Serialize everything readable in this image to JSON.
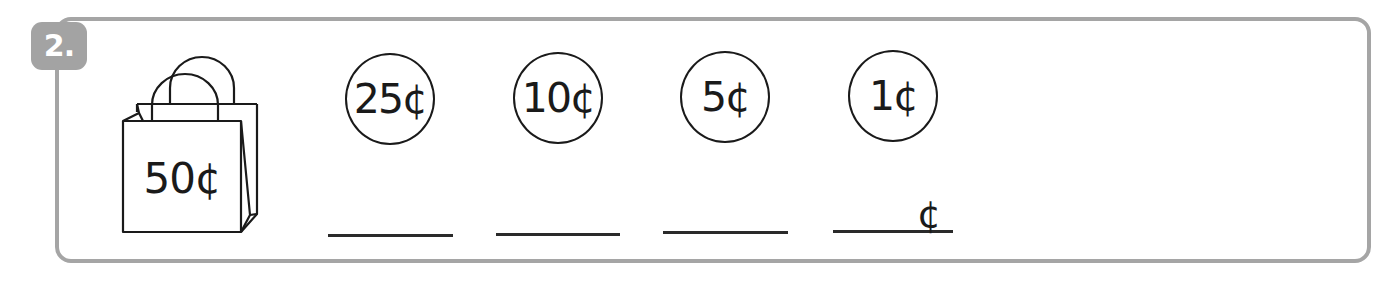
{
  "problem": {
    "number": "2.",
    "bag_price": "50¢"
  },
  "coins": [
    {
      "label": "25¢",
      "value_cents": 25
    },
    {
      "label": "10¢",
      "value_cents": 10
    },
    {
      "label": "5¢",
      "value_cents": 5
    },
    {
      "label": "1¢",
      "value_cents": 1
    }
  ],
  "answers": [
    {
      "value": "",
      "suffix": ""
    },
    {
      "value": "",
      "suffix": ""
    },
    {
      "value": "",
      "suffix": ""
    },
    {
      "value": "",
      "suffix": "¢"
    }
  ],
  "colors": {
    "frame": "#a5a5a5",
    "badge": "#a3a3a3",
    "ink": "#1a1a1a"
  }
}
